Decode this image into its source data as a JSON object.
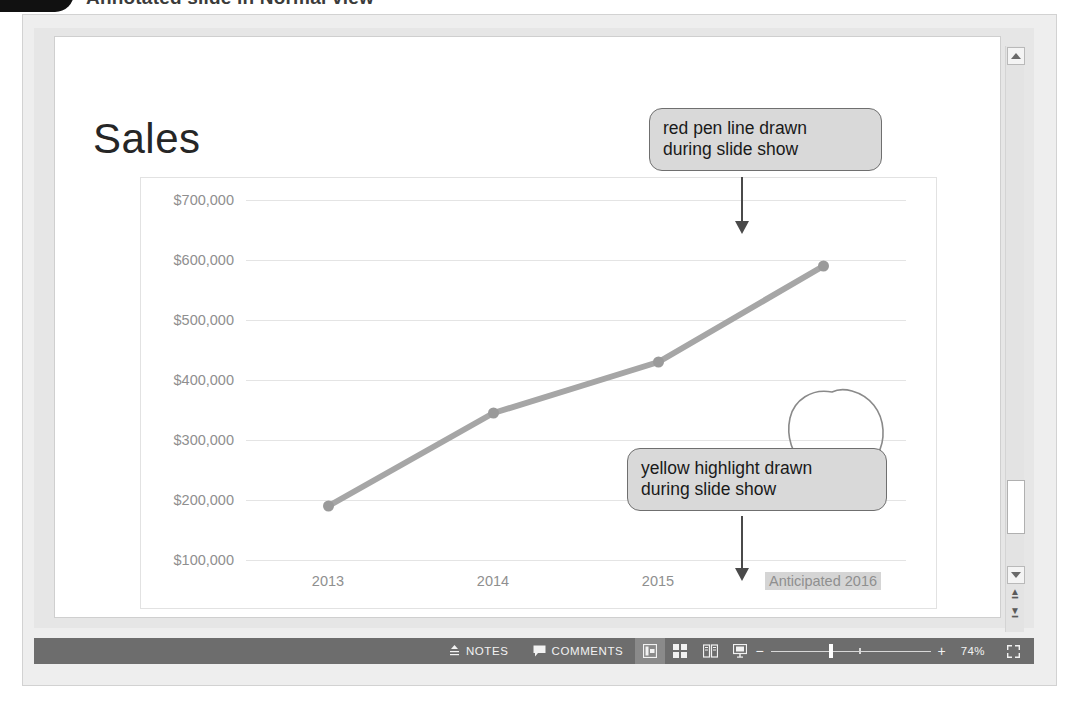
{
  "figure": {
    "caption": "Annotated slide in Normal view",
    "badge": "bullet-badge"
  },
  "slide": {
    "title": "Sales"
  },
  "chart_data": {
    "type": "line",
    "title": "Sales",
    "xlabel": "",
    "ylabel": "",
    "categories": [
      "2013",
      "2014",
      "2015",
      "Anticipated 2016"
    ],
    "values": [
      190000,
      345000,
      430000,
      590000
    ],
    "series": [
      {
        "name": "Sales",
        "values": [
          190000,
          345000,
          430000,
          590000
        ]
      }
    ],
    "ylim": [
      100000,
      700000
    ],
    "yticks": [
      "$700,000",
      "$600,000",
      "$500,000",
      "$400,000",
      "$300,000",
      "$200,000",
      "$100,000"
    ],
    "ytick_values": [
      700000,
      600000,
      500000,
      400000,
      300000,
      200000,
      100000
    ],
    "grid": true,
    "legend": false,
    "legend_position": "none",
    "line_color": "#a6a6a6",
    "marker_color": "#9a9a9a",
    "highlighted_category": "Anticipated 2016",
    "highlight_color": "#d5d5d5",
    "annotations": [
      {
        "type": "pen-circle",
        "target": "Anticipated 2016",
        "color": "#8a8a8a"
      },
      {
        "type": "highlight",
        "target": "Anticipated 2016",
        "color": "#d5d5d5"
      }
    ]
  },
  "callouts": [
    {
      "id": "pen",
      "text": "red pen line drawn\nduring slide show"
    },
    {
      "id": "highlight",
      "text": "yellow highlight drawn\nduring slide show"
    }
  ],
  "status_bar": {
    "notes_label": "NOTES",
    "comments_label": "COMMENTS",
    "notes_icon": "notes-icon",
    "comments_icon": "comment-bubble-icon",
    "views": [
      {
        "name": "normal-view",
        "icon": "normal-view-icon",
        "active": true
      },
      {
        "name": "slide-sorter-view",
        "icon": "slide-sorter-icon",
        "active": false
      },
      {
        "name": "reading-view",
        "icon": "reading-view-icon",
        "active": false
      },
      {
        "name": "slide-show-view",
        "icon": "slide-show-icon",
        "active": false
      }
    ],
    "zoom_out": "−",
    "zoom_in": "+",
    "zoom_level": "74%",
    "fit_icon": "fit-to-window-icon"
  },
  "scrollbar": {
    "up_icon": "scroll-up-icon",
    "down_icon": "scroll-down-icon",
    "prev_slide_icon": "previous-slide-icon",
    "next_slide_icon": "next-slide-icon"
  }
}
